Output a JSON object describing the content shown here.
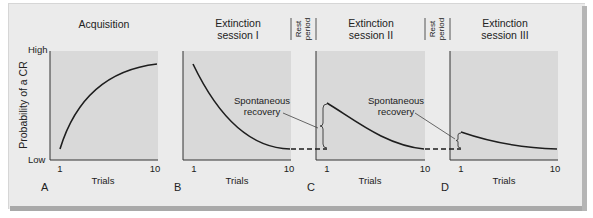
{
  "figure": {
    "y_axis_label": "Probability of a CR",
    "y_high_label": "High",
    "y_low_label": "Low",
    "x_axis_label": "Trials",
    "rest_period_label_line1": "Rest",
    "rest_period_label_line2": "period",
    "annotation_label_line1": "Spontaneous",
    "annotation_label_line2": "recovery",
    "colors": {
      "card": "#ebebeb",
      "plot_area": "#d9d9d9",
      "curve": "#1e1e1e",
      "shadow": "#a9a9a9"
    },
    "panels": [
      {
        "letter": "A",
        "title_line1": "Acquisition",
        "title_line2": "",
        "x_start": "1",
        "x_end": "10"
      },
      {
        "letter": "B",
        "title_line1": "Extinction",
        "title_line2": "session I",
        "x_start": "1",
        "x_end": "10"
      },
      {
        "letter": "C",
        "title_line1": "Extinction",
        "title_line2": "session II",
        "x_start": "1",
        "x_end": "10"
      },
      {
        "letter": "D",
        "title_line1": "Extinction",
        "title_line2": "session III",
        "x_start": "1",
        "x_end": "10"
      }
    ]
  }
}
